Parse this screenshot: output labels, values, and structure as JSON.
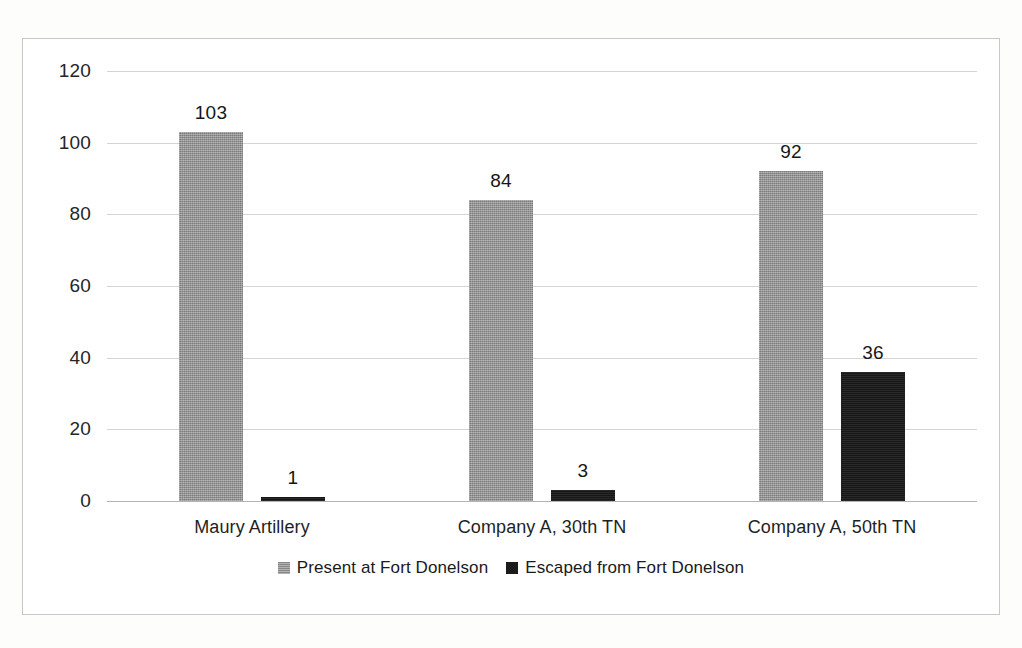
{
  "chart_data": {
    "type": "bar",
    "title": "",
    "subtitle": "",
    "xlabel": "",
    "ylabel": "",
    "ylim": [
      0,
      120
    ],
    "yticks": [
      0,
      20,
      40,
      60,
      80,
      100,
      120
    ],
    "ytick_labels": [
      "0",
      "20",
      "40",
      "60",
      "80",
      "100",
      "120"
    ],
    "grid": true,
    "legend_position": "bottom",
    "categories": [
      "Maury Artillery",
      "Company A, 30th TN",
      "Company A, 50th TN"
    ],
    "series": [
      {
        "name": "Present at Fort Donelson",
        "color": "#969696",
        "values": [
          103,
          84,
          92
        ],
        "labels": [
          "103",
          "84",
          "92"
        ]
      },
      {
        "name": "Escaped from Fort Donelson",
        "color": "#1c1c1c",
        "values": [
          1,
          3,
          36
        ],
        "labels": [
          "1",
          "3",
          "36"
        ]
      }
    ]
  },
  "legend": {
    "items": [
      {
        "label": "Present at Fort Donelson",
        "swatch": "gray-square-icon"
      },
      {
        "label": "Escaped from Fort Donelson",
        "swatch": "black-square-icon"
      }
    ]
  },
  "colors": {
    "present": "#969696",
    "escaped": "#1c1c1c",
    "gridline": "#d4d4d4",
    "frame_border": "#c8c8c8",
    "background": "#ffffff"
  }
}
